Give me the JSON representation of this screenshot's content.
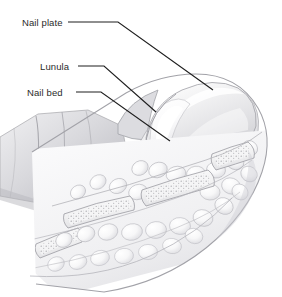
{
  "figure": {
    "background_color": "#ffffff",
    "width": 282,
    "height": 297
  },
  "labels": [
    {
      "id": "nail-plate",
      "text": "Nail plate",
      "text_x": 22,
      "text_y": 26,
      "leader": "M 68 22 L 118 22 L 213 90",
      "target": "dorsal keratin plate surface"
    },
    {
      "id": "lunula",
      "text": "Lunula",
      "text_x": 40,
      "text_y": 70,
      "leader": "M 78 66 L 104 66 L 156 112",
      "target": "white crescent at nail base"
    },
    {
      "id": "nail-bed",
      "text": "Nail bed",
      "text_x": 27,
      "text_y": 96,
      "leader": "M 76 92 L 101 92 L 170 141",
      "target": "tissue beneath nail plate"
    }
  ],
  "anatomy": {
    "structures": [
      {
        "name": "nail-plate",
        "tone": "#e9e9ea",
        "description": "domed translucent keratin plate"
      },
      {
        "name": "lunula",
        "tone": "#fbfbfc",
        "description": "pale crescent at proximal nail"
      },
      {
        "name": "nail-bed",
        "tone": "#eeeef0",
        "description": "bed tissue under the plate"
      },
      {
        "name": "eponychium",
        "tone": "#e4e4e6",
        "description": "cuticle fold over plate base"
      },
      {
        "name": "skin-fold",
        "tone": "#dcdcde",
        "description": "lateral skin with creases"
      },
      {
        "name": "adipose-lobules",
        "tone": "#f4f4f5",
        "description": "rounded subcutaneous fat cells"
      },
      {
        "name": "distal-phalanx",
        "tone": "#f0f0f1",
        "description": "bone with trabecular stipple"
      },
      {
        "name": "hyponychium",
        "tone": "#ebebec",
        "description": "skin under the free edge"
      },
      {
        "name": "pulp-pad",
        "tone": "#f2f2f3",
        "description": "fingertip soft tissue pad"
      }
    ],
    "line_color": "#9a9a9f",
    "shade_dark": "#bcbcc0",
    "shade_mid": "#d6d6d9",
    "shade_light": "#f2f2f4"
  }
}
